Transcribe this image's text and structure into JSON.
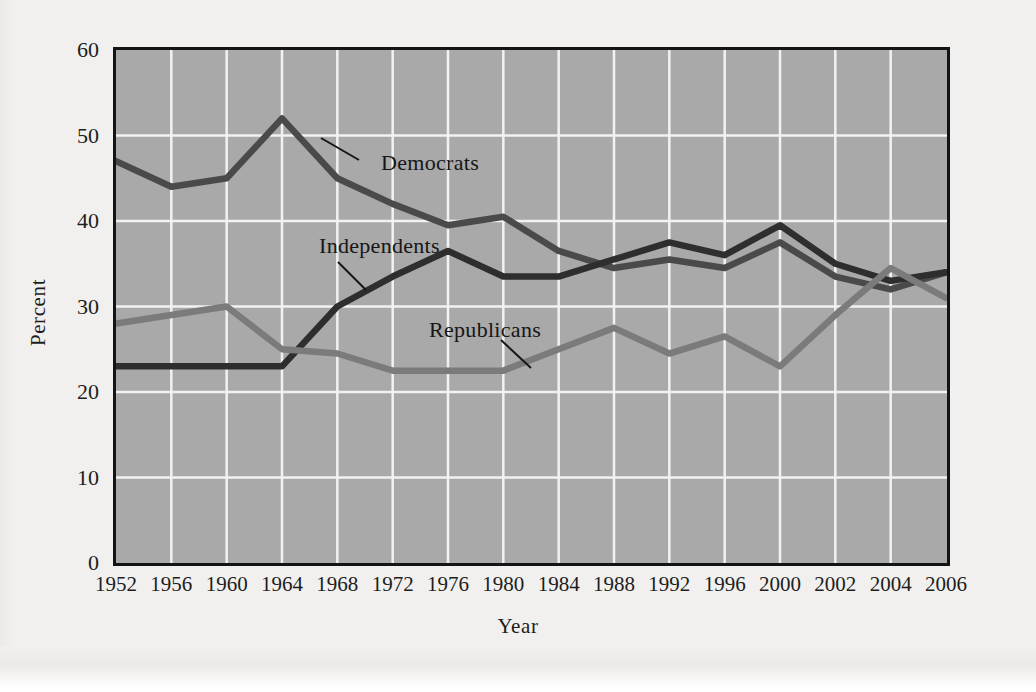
{
  "figure": {
    "background_color": "#f1f0ee",
    "plot_background_color": "#a9a9a9",
    "gridline_color": "#f2f2f2",
    "border_color": "#141414"
  },
  "chart_data": {
    "type": "line",
    "title": "",
    "xlabel": "Year",
    "ylabel": "Percent",
    "categories": [
      "1952",
      "1956",
      "1960",
      "1964",
      "1968",
      "1972",
      "1976",
      "1980",
      "1984",
      "1988",
      "1992",
      "1996",
      "2000",
      "2002",
      "2004",
      "2006"
    ],
    "x_tick_labels": [
      "1952",
      "1956",
      "1960",
      "1964",
      "1968",
      "1972",
      "1976",
      "1980",
      "1984",
      "1988",
      "1992",
      "1996",
      "2000",
      "2002",
      "2004",
      "2006"
    ],
    "y_tick_labels": [
      "0",
      "10",
      "20",
      "30",
      "40",
      "50",
      "60"
    ],
    "y_ticks": [
      0,
      10,
      20,
      30,
      40,
      50,
      60
    ],
    "ylim": [
      0,
      60
    ],
    "grid": "both",
    "legend": "inline-annotations",
    "series": [
      {
        "name": "Democrats",
        "color": "#4a4a4a",
        "values": [
          47,
          44,
          45,
          52,
          45,
          42,
          39.5,
          40.5,
          36.5,
          34.5,
          35.5,
          34.5,
          37.5,
          33.5,
          32,
          34
        ]
      },
      {
        "name": "Independents",
        "color": "#2e2e2e",
        "values": [
          23,
          23,
          23,
          23,
          30,
          33.5,
          36.5,
          33.5,
          33.5,
          35.5,
          37.5,
          36,
          39.5,
          35,
          33,
          34
        ]
      },
      {
        "name": "Republicans",
        "color": "#7b7b7b",
        "values": [
          28,
          29,
          30,
          25,
          24.5,
          22.5,
          22.5,
          22.5,
          25,
          27.5,
          24.5,
          26.5,
          23,
          29,
          34.5,
          31
        ]
      }
    ],
    "annotations": [
      {
        "text": "Democrats",
        "series": "Democrats",
        "anchor_year": "1964"
      },
      {
        "text": "Independents",
        "series": "Independents",
        "anchor_year": "1972"
      },
      {
        "text": "Republicans",
        "series": "Republicans",
        "anchor_year": "1984"
      }
    ]
  }
}
